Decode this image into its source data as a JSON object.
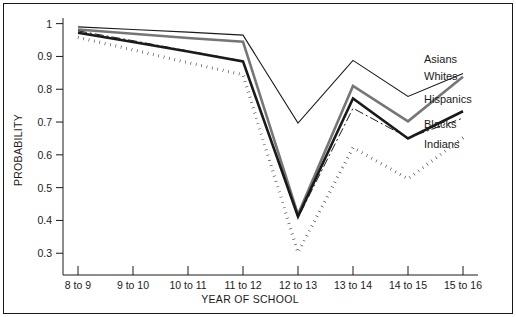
{
  "chart_data": {
    "type": "line",
    "title": "",
    "xlabel": "YEAR OF SCHOOL",
    "ylabel": "PROBABILITY",
    "categories": [
      "8 to 9",
      "9 to 10",
      "10 to 11",
      "11 to 12",
      "12 to 13",
      "13 to 14",
      "14 to 15",
      "15 to 16"
    ],
    "ylim": [
      0.255,
      1.005
    ],
    "yticks": [
      0.3,
      0.4,
      0.5,
      0.6,
      0.7,
      0.8,
      0.9,
      1
    ],
    "ytick_labels": [
      "0.3",
      "0.4",
      "0.5",
      "0.6",
      "0.7",
      "0.8",
      "0.9",
      "1"
    ],
    "grid": false,
    "legend_position": "right-inline-labels",
    "series": [
      {
        "name": "Asians",
        "style": "solid-thin",
        "color": "#1a1a1a",
        "values": [
          0.99,
          0.982,
          0.974,
          0.965,
          0.697,
          0.888,
          0.778,
          0.848
        ]
      },
      {
        "name": "Whites",
        "style": "solid-thick-gray",
        "color": "#767676",
        "values": [
          0.982,
          0.969,
          0.956,
          0.945,
          0.418,
          0.81,
          0.702,
          0.838
        ]
      },
      {
        "name": "Hispanics",
        "style": "solid-thick",
        "color": "#1a1a1a",
        "values": [
          0.972,
          0.944,
          0.915,
          0.885,
          0.412,
          0.772,
          0.65,
          0.733
        ]
      },
      {
        "name": "Blacks",
        "style": "dash-dot-thin",
        "color": "#1a1a1a",
        "values": [
          0.978,
          0.948,
          0.917,
          0.886,
          0.408,
          0.742,
          0.652,
          0.712
        ]
      },
      {
        "name": "Indians",
        "style": "dotted-thick",
        "color": "#1a1a1a",
        "values": [
          0.958,
          0.92,
          0.881,
          0.844,
          0.302,
          0.622,
          0.527,
          0.652
        ]
      }
    ]
  },
  "legend": {
    "labels": [
      "Asians",
      "Whites",
      "Hispanics",
      "Blacks",
      "Indians"
    ]
  }
}
